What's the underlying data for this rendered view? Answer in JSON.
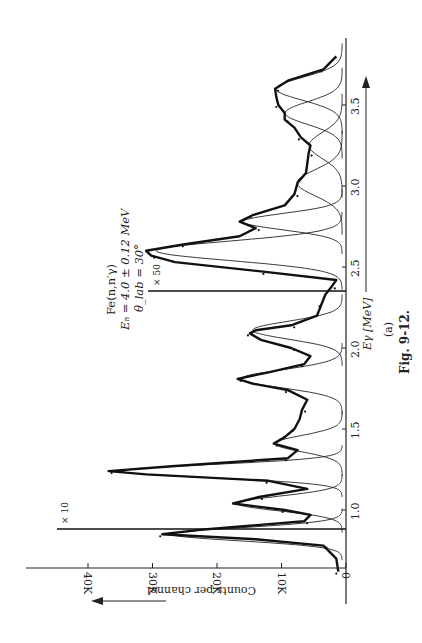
{
  "chart_data": {
    "type": "line",
    "orientation": "rotated-90-ccw",
    "title": "Fe(n,n′γ)",
    "annotations": {
      "reaction": "Fe(n,n′γ)",
      "energy": "Eₙ = 4.0 ± 0.12 MeV",
      "angle": "θ_lab = 30°",
      "scale_marker_1": "× 10",
      "scale_marker_2": "× 50",
      "panel": "(a)"
    },
    "xlabel": "Eγ [MeV]",
    "ylabel": "Counts per channel",
    "xlim": [
      0.6,
      3.85
    ],
    "ylim": [
      0,
      45000
    ],
    "x_ticks": [
      {
        "value": 1.0,
        "label": "1.0"
      },
      {
        "value": 1.5,
        "label": "1.5"
      },
      {
        "value": 2.0,
        "label": "2.0"
      },
      {
        "value": 2.5,
        "label": "2.5"
      },
      {
        "value": 3.0,
        "label": "3.0"
      },
      {
        "value": 3.5,
        "label": "3.5"
      }
    ],
    "y_ticks": [
      {
        "value": 0,
        "label": "0"
      },
      {
        "value": 10000,
        "label": "10K"
      },
      {
        "value": 20000,
        "label": "20K"
      },
      {
        "value": 30000,
        "label": "30K"
      },
      {
        "value": 40000,
        "label": "40K"
      }
    ],
    "scale_changes": [
      {
        "at_energy": 0.97,
        "factor": 10,
        "label": "× 10"
      },
      {
        "at_energy": 2.42,
        "factor": 50,
        "label": "× 50"
      }
    ],
    "peaks": [
      {
        "energy": 0.85,
        "counts_displayed": 28500
      },
      {
        "energy": 1.04,
        "counts_displayed": 17500
      },
      {
        "energy": 1.24,
        "counts_displayed": 36800
      },
      {
        "energy": 1.41,
        "counts_displayed": 11200
      },
      {
        "energy": 1.81,
        "counts_displayed": 16800
      },
      {
        "energy": 2.11,
        "counts_displayed": 14900
      },
      {
        "energy": 2.6,
        "counts_displayed": 31000
      },
      {
        "energy": 2.78,
        "counts_displayed": 16500
      },
      {
        "energy": 3.02,
        "counts_displayed": 7500
      },
      {
        "energy": 3.25,
        "counts_displayed": 5500
      },
      {
        "energy": 3.45,
        "counts_displayed": 9500
      },
      {
        "energy": 3.6,
        "counts_displayed": 11000
      }
    ],
    "fit_curve": {
      "x": [
        0.62,
        0.7,
        0.78,
        0.82,
        0.85,
        0.88,
        0.93,
        0.97,
        1.0,
        1.04,
        1.08,
        1.13,
        1.18,
        1.22,
        1.24,
        1.27,
        1.32,
        1.37,
        1.41,
        1.45,
        1.5,
        1.56,
        1.62,
        1.68,
        1.74,
        1.78,
        1.81,
        1.85,
        1.9,
        1.95,
        2.0,
        2.05,
        2.09,
        2.11,
        2.14,
        2.2,
        2.27,
        2.33,
        2.38,
        2.42,
        2.47,
        2.53,
        2.57,
        2.6,
        2.64,
        2.69,
        2.74,
        2.78,
        2.82,
        2.88,
        2.95,
        3.02,
        3.08,
        3.14,
        3.2,
        3.25,
        3.3,
        3.36,
        3.41,
        3.45,
        3.5,
        3.55,
        3.6,
        3.65,
        3.72,
        3.8
      ],
      "y": [
        1200,
        1500,
        3500,
        14000,
        28500,
        22000,
        6500,
        5500,
        9500,
        17500,
        13500,
        6000,
        12000,
        31000,
        36800,
        27000,
        9000,
        7500,
        11200,
        9500,
        8000,
        7200,
        6800,
        6000,
        9000,
        14500,
        16800,
        12000,
        6500,
        5500,
        8500,
        13200,
        14900,
        14000,
        8500,
        4500,
        3800,
        3200,
        2200,
        1500,
        12500,
        26500,
        30200,
        31000,
        25000,
        16500,
        14000,
        16500,
        14500,
        9500,
        8000,
        7500,
        6200,
        6000,
        5800,
        5500,
        7000,
        8000,
        9500,
        9500,
        10500,
        10800,
        11000,
        9000,
        3500,
        1500
      ]
    },
    "components": [
      {
        "center": 0.85,
        "height": 28500,
        "width": 0.04
      },
      {
        "center": 1.04,
        "height": 17500,
        "width": 0.045
      },
      {
        "center": 1.24,
        "height": 36800,
        "width": 0.04
      },
      {
        "center": 1.41,
        "height": 11200,
        "width": 0.05
      },
      {
        "center": 1.81,
        "height": 16800,
        "width": 0.055
      },
      {
        "center": 2.11,
        "height": 14900,
        "width": 0.055
      },
      {
        "center": 2.6,
        "height": 31000,
        "width": 0.06
      },
      {
        "center": 2.78,
        "height": 16500,
        "width": 0.05
      },
      {
        "center": 3.02,
        "height": 7500,
        "width": 0.08
      },
      {
        "center": 3.25,
        "height": 5500,
        "width": 0.08
      },
      {
        "center": 3.45,
        "height": 9500,
        "width": 0.07
      },
      {
        "center": 3.6,
        "height": 11000,
        "width": 0.07
      }
    ],
    "legend": [],
    "grid": false
  },
  "caption": {
    "figure": "Fig. 9-12.",
    "panel": "(a)"
  },
  "axes": {
    "xlabel": "Eγ [MeV]",
    "ylabel": "Counts per channel"
  }
}
